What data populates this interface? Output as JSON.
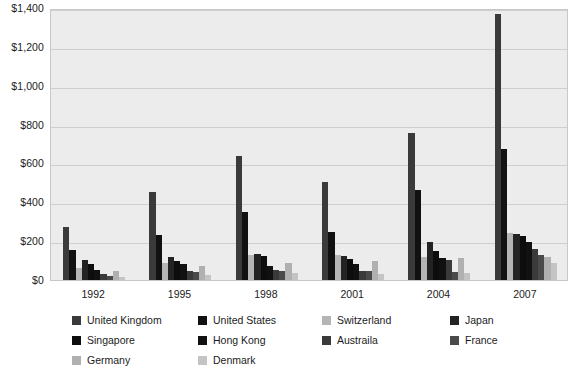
{
  "chart_data": {
    "type": "bar",
    "title": "",
    "subtitle": "",
    "xlabel": "",
    "ylabel": "",
    "ylim": [
      0,
      1400
    ],
    "ytick_step": 200,
    "ytick_labels": [
      "$0",
      "$200",
      "$400",
      "$600",
      "$800",
      "$1,000",
      "$1,200",
      "$1,400"
    ],
    "ytick_values": [
      0,
      200,
      400,
      600,
      800,
      1000,
      1200,
      1400
    ],
    "grid": true,
    "legend_position": "bottom",
    "categories": [
      "1992",
      "1995",
      "1998",
      "2001",
      "2004",
      "2007"
    ],
    "xtick_labels": [
      "1992",
      "1995",
      "1998",
      "2001",
      "2004",
      "2007"
    ],
    "series": [
      {
        "name": "United Kingdom",
        "color": "#3a3a3a",
        "values": [
          275,
          452,
          637,
          505,
          757,
          1367
        ]
      },
      {
        "name": "United States",
        "color": "#111111",
        "values": [
          152,
          232,
          350,
          248,
          465,
          672
        ]
      },
      {
        "name": "Switzerland",
        "color": "#b5b5b5",
        "values": [
          62,
          88,
          128,
          128,
          120,
          240
        ]
      },
      {
        "name": "Japan",
        "color": "#232323",
        "values": [
          105,
          118,
          132,
          122,
          196,
          237
        ]
      },
      {
        "name": "Singapore",
        "color": "#0d0d0d",
        "values": [
          82,
          98,
          126,
          108,
          150,
          224
        ]
      },
      {
        "name": "Hong Kong",
        "color": "#111111",
        "values": [
          52,
          82,
          70,
          84,
          112,
          196
        ]
      },
      {
        "name": "Austraila",
        "color": "#3a3a3a",
        "values": [
          30,
          46,
          50,
          44,
          104,
          162
        ]
      },
      {
        "name": "France",
        "color": "#4a4a4a",
        "values": [
          22,
          40,
          46,
          44,
          40,
          130
        ]
      },
      {
        "name": "Germany",
        "color": "#b0b0b0",
        "values": [
          48,
          72,
          88,
          98,
          112,
          118
        ]
      },
      {
        "name": "Denmark",
        "color": "#c4c4c4",
        "values": [
          14,
          26,
          34,
          30,
          34,
          88
        ]
      }
    ]
  },
  "legend": {
    "columns": [
      [
        "United Kingdom",
        "Singapore",
        "Germany"
      ],
      [
        "United States",
        "Hong Kong",
        "Denmark"
      ],
      [
        "Switzerland",
        "Austraila",
        ""
      ],
      [
        "Japan",
        "France",
        ""
      ]
    ]
  },
  "colors": {
    "plot_background": "#ececec",
    "gridline": "#cfcfcf",
    "frame_border": "#c8c8c8",
    "page_background": "#ffffff",
    "text": "#1b1b1b"
  }
}
